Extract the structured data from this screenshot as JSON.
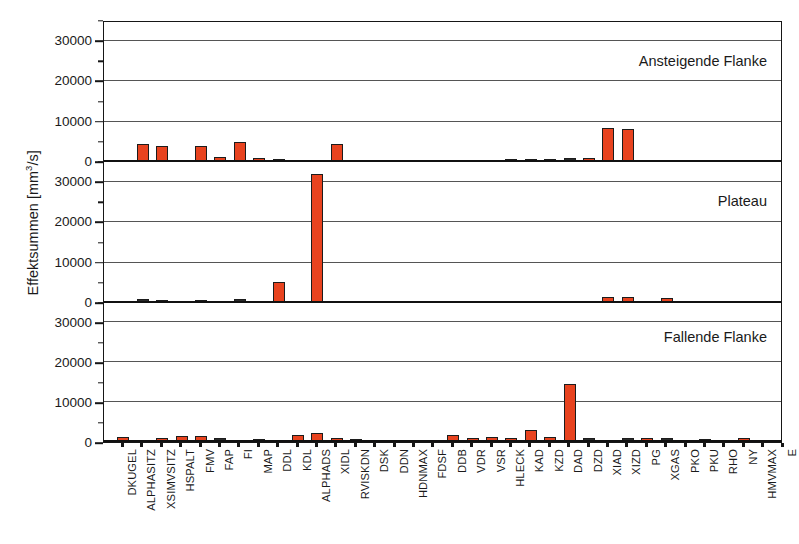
{
  "chart_data": {
    "type": "bar",
    "title": "",
    "subtitle": "",
    "xlabel": "",
    "ylabel": "Effektsummen [mm³/s]",
    "ylabel_parts": {
      "text": "Effektsummen [mm",
      "sup": "3",
      "tail": "/s]"
    },
    "grid": true,
    "legend": false,
    "legend_position": "none",
    "bar_color": "#e8431f",
    "bar_edge_color": "#1c1c1c",
    "axis_color": "#161616",
    "grid_color": "#555555",
    "ylim": [
      0,
      35000
    ],
    "yticks_major": [
      0,
      10000,
      20000,
      30000
    ],
    "yticks_major_labels": [
      "0",
      "10000",
      "20000",
      "30000"
    ],
    "yticks_minor": [
      5000,
      15000,
      25000,
      35000
    ],
    "panels": [
      {
        "name": "Ansteigende Flanke",
        "annotation": "Ansteigende Flanke",
        "values": [
          600,
          4500,
          4000,
          300,
          3900,
          1300,
          5000,
          1100,
          700,
          150,
          200,
          4500,
          500,
          150,
          120,
          100,
          80,
          60,
          50,
          40,
          700,
          800,
          800,
          900,
          1100,
          8500,
          8200,
          600,
          500,
          150,
          120,
          100,
          80,
          60
        ]
      },
      {
        "name": "Plateau",
        "annotation": "Plateau",
        "values": [
          250,
          900,
          800,
          200,
          700,
          250,
          900,
          300,
          5200,
          150,
          32000,
          200,
          150,
          120,
          100,
          80,
          60,
          50,
          40,
          30,
          60,
          80,
          60,
          600,
          400,
          1500,
          1600,
          300,
          1200,
          200,
          150,
          120,
          100,
          80
        ]
      },
      {
        "name": "Fallende Flanke",
        "annotation": "Fallende Flanke",
        "values": [
          1300,
          300,
          1100,
          1400,
          1500,
          900,
          200,
          700,
          500,
          1700,
          2200,
          1100,
          800,
          500,
          600,
          200,
          150,
          1700,
          1100,
          1300,
          1000,
          3000,
          1200,
          14500,
          900,
          600,
          900,
          1000,
          900,
          300,
          800,
          200,
          1000,
          150
        ]
      }
    ],
    "categories": [
      "DKUGEL",
      "ALPHASITZ",
      "XSIMVSITZ",
      "HSPALT",
      "FMV",
      "FAP",
      "FI",
      "MAP",
      "DDL",
      "KDL",
      "ALPHADS",
      "XIDL",
      "RVISKDN",
      "DSK",
      "DDN",
      "HDNMAX",
      "FDSF",
      "DDB",
      "VDR",
      "VSR",
      "HLECK",
      "KAD",
      "KZD",
      "DAD",
      "DZD",
      "XIAD",
      "XIZD",
      "PG",
      "XGAS",
      "PKO",
      "PKU",
      "RHO",
      "NY",
      "HMVMAX"
    ],
    "extra_tick_label": "E",
    "n_categories": 34
  }
}
